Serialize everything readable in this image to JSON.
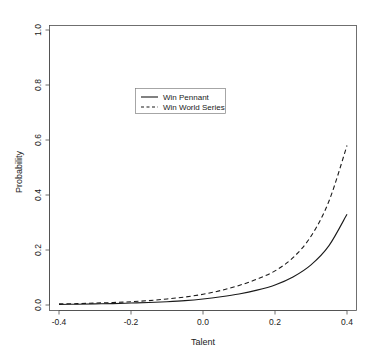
{
  "chart_data": {
    "type": "line",
    "title": "",
    "xlabel": "Talent",
    "ylabel": "Probability",
    "xlim": [
      -0.45,
      0.45
    ],
    "ylim": [
      0.0,
      1.04
    ],
    "xticks": [
      "-0.4",
      "-0.2",
      "0.0",
      "0.2",
      "0.4"
    ],
    "xtick_values": [
      -0.4,
      -0.2,
      0.0,
      0.2,
      0.4
    ],
    "yticks": [
      "0.0",
      "0.2",
      "0.4",
      "0.6",
      "0.8",
      "1.0"
    ],
    "ytick_values": [
      0.0,
      0.2,
      0.4,
      0.6,
      0.8,
      1.0
    ],
    "grid": false,
    "legend_position": "top-center",
    "series": [
      {
        "name": "Win Pennant",
        "style": "solid",
        "color": "#1a1a1a",
        "x": [
          -0.4,
          -0.35,
          -0.3,
          -0.25,
          -0.2,
          -0.15,
          -0.1,
          -0.05,
          0.0,
          0.05,
          0.1,
          0.15,
          0.2,
          0.25,
          0.3,
          0.35,
          0.4
        ],
        "values": [
          0.002,
          0.003,
          0.004,
          0.005,
          0.007,
          0.009,
          0.012,
          0.016,
          0.022,
          0.03,
          0.04,
          0.054,
          0.073,
          0.102,
          0.146,
          0.216,
          0.33
        ]
      },
      {
        "name": "Win World Series",
        "style": "dashed",
        "color": "#1a1a1a",
        "x": [
          -0.4,
          -0.35,
          -0.3,
          -0.25,
          -0.2,
          -0.15,
          -0.1,
          -0.05,
          0.0,
          0.05,
          0.1,
          0.15,
          0.2,
          0.25,
          0.3,
          0.35,
          0.4
        ],
        "values": [
          0.004,
          0.005,
          0.007,
          0.009,
          0.012,
          0.016,
          0.022,
          0.029,
          0.039,
          0.053,
          0.071,
          0.094,
          0.124,
          0.172,
          0.25,
          0.378,
          0.58
        ]
      }
    ]
  },
  "legend": {
    "entries": [
      {
        "label": "Win Pennant",
        "style": "solid"
      },
      {
        "label": "Win World Series",
        "style": "dashed"
      }
    ]
  }
}
